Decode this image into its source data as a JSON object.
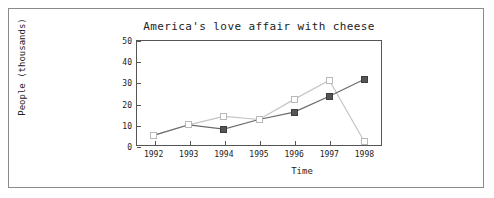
{
  "figure": {
    "border_color": "#8a8a8a",
    "background": "#ffffff"
  },
  "chart_data": {
    "type": "line",
    "title": "America's love affair with cheese",
    "xlabel": "Time",
    "ylabel": "People (thousands)",
    "categories": [
      "1992",
      "1993",
      "1994",
      "1995",
      "1996",
      "1997",
      "1998"
    ],
    "x": [
      1992,
      1993,
      1994,
      1995,
      1996,
      1997,
      1998
    ],
    "xlim": [
      1991.5,
      1998.5
    ],
    "ylim": [
      0,
      50
    ],
    "yticks": [
      0,
      10,
      20,
      30,
      40,
      50
    ],
    "ytick_labels": [
      "0",
      "10",
      "20",
      "30",
      "40",
      "50"
    ],
    "grid": false,
    "legend": "none",
    "series": [
      {
        "name": "series-dark",
        "marker": "filled-square",
        "color": "#555555",
        "values": [
          5,
          10,
          8,
          12.5,
          16,
          23.5,
          31.5
        ]
      },
      {
        "name": "series-light",
        "marker": "open-square",
        "color": "#b9b9b9",
        "values": [
          5,
          10,
          14,
          12.5,
          22,
          31,
          2
        ]
      }
    ]
  }
}
